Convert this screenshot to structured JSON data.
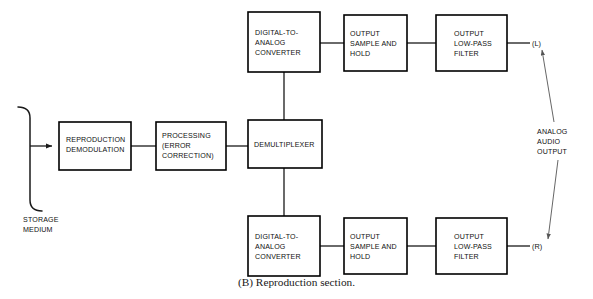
{
  "figure": {
    "caption": "(B) Reproduction section."
  },
  "blocks": [
    {
      "id": "reproduction-demodulation",
      "lines": [
        "REPRODUCTION",
        "DEMODULATION"
      ]
    },
    {
      "id": "processing-error-correction",
      "lines": [
        "PROCESSING",
        "(ERROR",
        "CORRECTION)"
      ]
    },
    {
      "id": "demultiplexer",
      "lines": [
        "DEMULTIPLEXER"
      ]
    },
    {
      "id": "dac-left",
      "lines": [
        "DIGITAL-TO-",
        "ANALOG",
        "CONVERTER"
      ]
    },
    {
      "id": "sample-hold-left",
      "lines": [
        "OUTPUT",
        "SAMPLE AND",
        "HOLD"
      ]
    },
    {
      "id": "low-pass-left",
      "lines": [
        "OUTPUT",
        "LOW-PASS",
        "FILTER"
      ]
    },
    {
      "id": "dac-right",
      "lines": [
        "DIGITAL-TO-",
        "ANALOG",
        "CONVERTER"
      ]
    },
    {
      "id": "sample-hold-right",
      "lines": [
        "OUTPUT",
        "SAMPLE AND",
        "HOLD"
      ]
    },
    {
      "id": "low-pass-right",
      "lines": [
        "OUTPUT",
        "LOW-PASS",
        "FILTER"
      ]
    }
  ],
  "annotations": {
    "storage_medium": [
      "STORAGE",
      "MEDIUM"
    ],
    "analog_audio_output": [
      "ANALOG",
      "AUDIO",
      "OUTPUT"
    ],
    "left_channel": "(L)",
    "right_channel": "(R)"
  },
  "colors": {
    "background": "#ffffff",
    "stroke": "#000000",
    "wire": "#1a1a1a",
    "leader": "#555555",
    "text": "#111111"
  }
}
